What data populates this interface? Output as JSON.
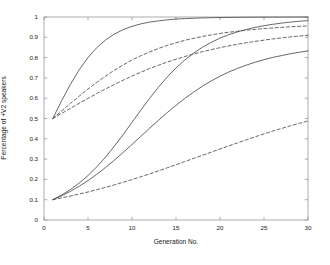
{
  "chart_data": {
    "type": "line",
    "title": "",
    "xlabel": "Generation No.",
    "ylabel": "Percentage of +V2 speakers",
    "xlim": [
      0,
      30
    ],
    "ylim": [
      0,
      1
    ],
    "xticks": [
      "0",
      "5",
      "10",
      "15",
      "20",
      "25",
      "30"
    ],
    "xtick_values": [
      0,
      5,
      10,
      15,
      20,
      25,
      30
    ],
    "yticks": [
      "0",
      "0.1",
      "0.2",
      "0.3",
      "0.4",
      "0.5",
      "0.6",
      "0.7",
      "0.8",
      "0.9",
      "1"
    ],
    "ytick_values": [
      0,
      0.1,
      0.2,
      0.3,
      0.4,
      0.5,
      0.6,
      0.7,
      0.8,
      0.9,
      1
    ],
    "grid": false,
    "legend": null,
    "legend_position": "none",
    "line_color": "#4d4d4d",
    "axis_color": "#999999",
    "x": [
      1,
      2,
      3,
      4,
      5,
      6,
      7,
      8,
      9,
      10,
      11,
      12,
      13,
      14,
      15,
      16,
      17,
      18,
      19,
      20,
      21,
      22,
      23,
      24,
      25,
      26,
      27,
      28,
      29,
      30
    ],
    "series": [
      {
        "name": "start-0.5-solid-fast",
        "style": "solid",
        "values": [
          0.5,
          0.587,
          0.668,
          0.74,
          0.8,
          0.849,
          0.887,
          0.916,
          0.938,
          0.954,
          0.966,
          0.975,
          0.981,
          0.986,
          0.99,
          0.992,
          0.994,
          0.9955,
          0.9966,
          0.9974,
          0.998,
          0.9985,
          0.9988,
          0.9991,
          0.9993,
          0.9995,
          0.9996,
          0.9997,
          0.9998,
          0.9998
        ]
      },
      {
        "name": "start-0.5-dashed-medium",
        "style": "dashed",
        "values": [
          0.5,
          0.537,
          0.574,
          0.61,
          0.645,
          0.678,
          0.709,
          0.738,
          0.764,
          0.788,
          0.809,
          0.828,
          0.845,
          0.86,
          0.873,
          0.885,
          0.895,
          0.904,
          0.912,
          0.919,
          0.925,
          0.93,
          0.935,
          0.939,
          0.943,
          0.946,
          0.949,
          0.952,
          0.954,
          0.956
        ]
      },
      {
        "name": "start-0.5-dashed-slow",
        "style": "dashed",
        "values": [
          0.5,
          0.525,
          0.55,
          0.575,
          0.599,
          0.623,
          0.646,
          0.668,
          0.689,
          0.709,
          0.728,
          0.746,
          0.762,
          0.778,
          0.792,
          0.805,
          0.818,
          0.829,
          0.839,
          0.849,
          0.858,
          0.866,
          0.873,
          0.88,
          0.886,
          0.892,
          0.897,
          0.902,
          0.906,
          0.91
        ]
      },
      {
        "name": "start-0.1-solid-fast",
        "style": "solid",
        "values": [
          0.1,
          0.123,
          0.15,
          0.182,
          0.219,
          0.262,
          0.31,
          0.364,
          0.421,
          0.481,
          0.541,
          0.599,
          0.654,
          0.704,
          0.749,
          0.788,
          0.822,
          0.851,
          0.875,
          0.896,
          0.913,
          0.927,
          0.939,
          0.949,
          0.957,
          0.964,
          0.97,
          0.975,
          0.979,
          0.982
        ]
      },
      {
        "name": "start-0.1-solid-medium",
        "style": "solid",
        "values": [
          0.1,
          0.119,
          0.141,
          0.166,
          0.194,
          0.225,
          0.259,
          0.295,
          0.333,
          0.372,
          0.412,
          0.452,
          0.491,
          0.529,
          0.565,
          0.599,
          0.63,
          0.659,
          0.685,
          0.708,
          0.729,
          0.747,
          0.763,
          0.777,
          0.79,
          0.801,
          0.81,
          0.819,
          0.826,
          0.833
        ]
      },
      {
        "name": "start-0.1-dashed-slow",
        "style": "dashed",
        "values": [
          0.1,
          0.109,
          0.118,
          0.128,
          0.138,
          0.149,
          0.161,
          0.173,
          0.186,
          0.199,
          0.213,
          0.227,
          0.242,
          0.257,
          0.272,
          0.288,
          0.303,
          0.319,
          0.334,
          0.35,
          0.365,
          0.38,
          0.395,
          0.41,
          0.424,
          0.438,
          0.451,
          0.464,
          0.476,
          0.488
        ]
      }
    ]
  },
  "axes_geometry": {
    "left_px": 44,
    "right_px": 308,
    "top_px": 17,
    "bottom_px": 220
  }
}
